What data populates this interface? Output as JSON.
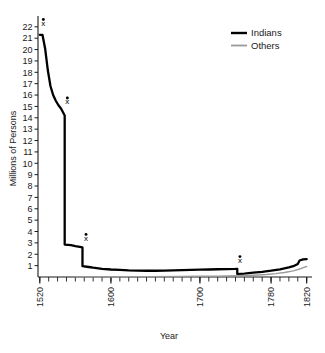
{
  "chart_data": {
    "type": "line",
    "title": "",
    "xlabel": "Year",
    "ylabel": "Millions of Persons",
    "xlim": [
      1518,
      1826
    ],
    "ylim": [
      0,
      22.6
    ],
    "grid": false,
    "legend_position": "top-right",
    "y_ticks": [
      1,
      2,
      3,
      4,
      5,
      6,
      7,
      8,
      9,
      10,
      11,
      12,
      13,
      14,
      15,
      16,
      17,
      18,
      19,
      20,
      21,
      22
    ],
    "y_tick_labels": [
      "1",
      "2",
      "3",
      "4",
      "5",
      "6",
      "7",
      "8",
      "9",
      "10",
      "11",
      "12",
      "13",
      "14",
      "15",
      "16",
      "17",
      "18",
      "19",
      "20",
      "21",
      "22"
    ],
    "x_ticks": [
      1520,
      1600,
      1700,
      1780,
      1820
    ],
    "x_tick_labels": [
      "1520",
      "1600",
      "1700",
      "1780",
      "1820"
    ],
    "x_minor_tick_step": 10,
    "series": [
      {
        "name": "Indians",
        "color": "#000000",
        "width": 2.3,
        "x": [
          1520,
          1523,
          1526,
          1529,
          1532,
          1535,
          1538,
          1541,
          1544,
          1548,
          1548,
          1555,
          1560,
          1565,
          1568,
          1568,
          1575,
          1580,
          1590,
          1600,
          1610,
          1620,
          1630,
          1640,
          1650,
          1660,
          1670,
          1680,
          1690,
          1700,
          1710,
          1720,
          1730,
          1740,
          1742,
          1742,
          1750,
          1760,
          1770,
          1780,
          1790,
          1800,
          1805,
          1810,
          1812,
          1816,
          1820
        ],
        "y": [
          21.3,
          21.3,
          20.1,
          18.2,
          16.8,
          16.0,
          15.5,
          15.1,
          14.8,
          14.2,
          2.85,
          2.8,
          2.72,
          2.65,
          2.6,
          0.95,
          0.88,
          0.82,
          0.72,
          0.66,
          0.62,
          0.58,
          0.56,
          0.55,
          0.55,
          0.56,
          0.58,
          0.6,
          0.62,
          0.64,
          0.66,
          0.68,
          0.7,
          0.71,
          0.72,
          0.26,
          0.3,
          0.38,
          0.46,
          0.56,
          0.68,
          0.84,
          0.95,
          1.15,
          1.45,
          1.55,
          1.58
        ]
      },
      {
        "name": "Others",
        "color": "#9a9a9a",
        "width": 1.4,
        "x": [
          1560,
          1600,
          1640,
          1680,
          1700,
          1720,
          1740,
          1760,
          1775,
          1785,
          1795,
          1805,
          1812,
          1816,
          1820
        ],
        "y": [
          0.01,
          0.02,
          0.03,
          0.05,
          0.06,
          0.08,
          0.11,
          0.16,
          0.22,
          0.3,
          0.4,
          0.54,
          0.7,
          0.82,
          0.92
        ]
      }
    ],
    "annotations": [
      {
        "label": "x",
        "x": 1524,
        "y": 22.1
      },
      {
        "label": "x",
        "x": 1551,
        "y": 15.2
      },
      {
        "label": "x",
        "x": 1572,
        "y": 3.2
      },
      {
        "label": "x",
        "x": 1745,
        "y": 1.25
      }
    ]
  },
  "legend": {
    "entries": [
      {
        "label": "Indians"
      },
      {
        "label": "Others"
      }
    ]
  }
}
